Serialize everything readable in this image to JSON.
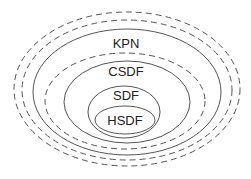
{
  "diagram": {
    "type": "nested-ellipses",
    "colors": {
      "stroke": "#555555",
      "text": "#222222",
      "background": "#ffffff"
    },
    "labels": {
      "kpn": "KPN",
      "csdf": "CSDF",
      "sdf": "SDF",
      "hsdf": "HSDF"
    },
    "ellipses": [
      {
        "name": "outer-dashed-1",
        "style": "dashed"
      },
      {
        "name": "outer-dashed-2",
        "style": "dashed"
      },
      {
        "name": "KPN",
        "style": "solid"
      },
      {
        "name": "inner-dashed",
        "style": "dashed"
      },
      {
        "name": "CSDF",
        "style": "solid"
      },
      {
        "name": "SDF",
        "style": "solid"
      },
      {
        "name": "HSDF",
        "style": "solid"
      }
    ]
  }
}
